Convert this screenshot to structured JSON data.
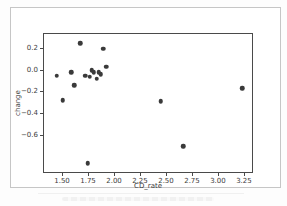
{
  "colors": {
    "card_border": "#c6c6c6",
    "spine": "#4a4a4a",
    "tick_text": "#3d3d3d",
    "marker": "#3a3a3a",
    "background": "#ffffff"
  },
  "chart_data": {
    "type": "scatter",
    "title": "",
    "xlabel": "CD_rate",
    "ylabel": "change",
    "xlim": [
      1.317,
      3.337
    ],
    "ylim": [
      -0.952,
      0.338
    ],
    "x_tick_values": [
      1.5,
      1.75,
      2.0,
      2.25,
      2.5,
      2.75,
      3.0,
      3.25
    ],
    "x_tick_labels": [
      "1.50",
      "1.75",
      "2.00",
      "2.25",
      "2.50",
      "2.75",
      "3.00",
      "3.25"
    ],
    "y_tick_values": [
      0.2,
      0.0,
      -0.2,
      -0.4,
      -0.6
    ],
    "y_tick_labels": [
      "0.2",
      "0.0",
      "−0.2",
      "−0.4",
      "−0.6"
    ],
    "grid": false,
    "legend": "none",
    "marker": {
      "size_px": 4.5,
      "color": "#3a3a3a"
    },
    "points": [
      [
        1.44,
        -0.05
      ],
      [
        1.5,
        -0.28
      ],
      [
        1.58,
        -0.02
      ],
      [
        1.61,
        -0.14
      ],
      [
        1.67,
        0.25
      ],
      [
        1.72,
        -0.05
      ],
      [
        1.74,
        -0.87
      ],
      [
        1.76,
        -0.06
      ],
      [
        1.78,
        0.0
      ],
      [
        1.8,
        -0.02
      ],
      [
        1.83,
        -0.08
      ],
      [
        1.85,
        -0.02
      ],
      [
        1.87,
        -0.04
      ],
      [
        1.89,
        0.2
      ],
      [
        1.92,
        0.03
      ],
      [
        2.45,
        -0.29
      ],
      [
        2.67,
        -0.71
      ],
      [
        3.24,
        -0.17
      ]
    ]
  }
}
